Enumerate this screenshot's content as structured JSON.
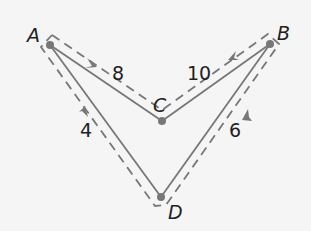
{
  "diagram": {
    "type": "graph",
    "colors": {
      "background": "#f5f5f5",
      "edge": "#777777",
      "node": "#777777",
      "path": "#777777",
      "text": "#222222"
    },
    "nodes": [
      {
        "id": "A",
        "label": "A",
        "x": 50,
        "y": 45
      },
      {
        "id": "B",
        "label": "B",
        "x": 270,
        "y": 44
      },
      {
        "id": "C",
        "label": "C",
        "x": 162,
        "y": 121
      },
      {
        "id": "D",
        "label": "D",
        "x": 161,
        "y": 197
      }
    ],
    "edges": [
      {
        "from": "A",
        "to": "C",
        "weight": "8"
      },
      {
        "from": "C",
        "to": "B",
        "weight": "10"
      },
      {
        "from": "A",
        "to": "D",
        "weight": "4"
      },
      {
        "from": "D",
        "to": "B",
        "weight": "6"
      }
    ],
    "labels": {
      "A": "A",
      "B": "B",
      "C": "C",
      "D": "D",
      "w_AC": "8",
      "w_CB": "10",
      "w_AD": "4",
      "w_DB": "6"
    },
    "cycle": {
      "style": "dashed",
      "order": [
        "A",
        "D",
        "B",
        "C",
        "A"
      ]
    }
  }
}
